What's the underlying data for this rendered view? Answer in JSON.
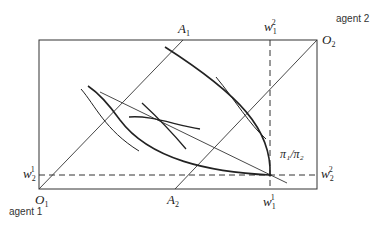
{
  "diagram": {
    "type": "edgeworth-box",
    "agents": {
      "agent1": "agent 1",
      "agent2": "agent 2"
    },
    "origins": {
      "o1": {
        "base": "O",
        "sub": "1"
      },
      "o2": {
        "base": "O",
        "sub": "2"
      }
    },
    "points": {
      "a1": {
        "base": "A",
        "sub": "1"
      },
      "a2": {
        "base": "A",
        "sub": "2"
      }
    },
    "endowments": {
      "w11": {
        "base": "w",
        "sub": "1",
        "sup": "1"
      },
      "w21": {
        "base": "w",
        "sub": "2",
        "sup": "1"
      },
      "w12": {
        "base": "w",
        "sub": "1",
        "sup": "2"
      },
      "w22": {
        "base": "w",
        "sub": "2",
        "sup": "2"
      }
    },
    "price_ratio": "π₁/π₂",
    "line_color": "#222222"
  }
}
